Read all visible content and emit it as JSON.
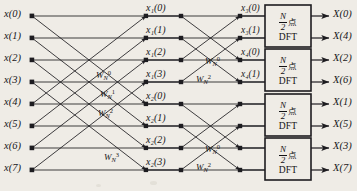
{
  "figure": {
    "kind": "fft-butterfly-signal-flow-graph",
    "background_color": "#efece6",
    "line_color": "#1d1c20",
    "text_color": "#18171a",
    "width": 357,
    "height": 191
  },
  "inputs": [
    {
      "label": "x(0)",
      "index": 0
    },
    {
      "label": "x(1)",
      "index": 1
    },
    {
      "label": "x(2)",
      "index": 2
    },
    {
      "label": "x(3)",
      "index": 3
    },
    {
      "label": "x(4)",
      "index": 4
    },
    {
      "label": "x(5)",
      "index": 5
    },
    {
      "label": "x(6)",
      "index": 6
    },
    {
      "label": "x(7)",
      "index": 7
    }
  ],
  "stage1_outputs": [
    {
      "label": "x₁(0)"
    },
    {
      "label": "x₁(1)"
    },
    {
      "label": "x₁(2)"
    },
    {
      "label": "x₁(3)"
    },
    {
      "label": "x₂(0)"
    },
    {
      "label": "x₂(1)"
    },
    {
      "label": "x₂(2)"
    },
    {
      "label": "x₂(3)"
    }
  ],
  "stage2_outputs": [
    {
      "label": "x₃(0)"
    },
    {
      "label": "x₃(1)"
    },
    {
      "label": "x₄(0)"
    },
    {
      "label": "x₄(1)"
    },
    {
      "label": ""
    },
    {
      "label": ""
    },
    {
      "label": ""
    },
    {
      "label": ""
    }
  ],
  "twiddles_stage1": [
    {
      "base": "W",
      "sub": "N",
      "sup": "0"
    },
    {
      "base": "W",
      "sub": "N",
      "sup": "1"
    },
    {
      "base": "W",
      "sub": "N",
      "sup": "2"
    },
    {
      "base": "W",
      "sub": "N",
      "sup": "3"
    }
  ],
  "twiddles_stage2": [
    {
      "base": "W",
      "sub": "N",
      "sup": "0"
    },
    {
      "base": "W",
      "sub": "N",
      "sup": "2"
    },
    {
      "base": "W",
      "sub": "N",
      "sup": "0"
    },
    {
      "base": "W",
      "sub": "N",
      "sup": "2"
    }
  ],
  "dft_blocks": [
    {
      "numerator": "N",
      "denominator": "2",
      "unit": "点",
      "name": "DFT",
      "outputs": [
        "X(0)",
        "X(4)"
      ]
    },
    {
      "numerator": "N",
      "denominator": "2",
      "unit": "点",
      "name": "DFT",
      "outputs": [
        "X(2)",
        "X(6)"
      ]
    },
    {
      "numerator": "N",
      "denominator": "2",
      "unit": "点",
      "name": "DFT",
      "outputs": [
        "X(1)",
        "X(5)"
      ]
    },
    {
      "numerator": "N",
      "denominator": "2",
      "unit": "点",
      "name": "DFT",
      "outputs": [
        "X(3)",
        "X(7)"
      ]
    }
  ],
  "outputs": [
    {
      "label": "X(0)"
    },
    {
      "label": "X(4)"
    },
    {
      "label": "X(2)"
    },
    {
      "label": "X(6)"
    },
    {
      "label": "X(1)"
    },
    {
      "label": "X(5)"
    },
    {
      "label": "X(3)"
    },
    {
      "label": "X(7)"
    }
  ]
}
